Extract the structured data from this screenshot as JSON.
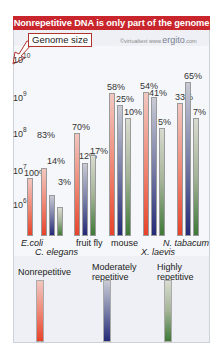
{
  "title": "Nonrepetitive DNA is only part of the genome",
  "genome_label": "Genome size",
  "copyright": {
    "prefix": "©virtualtext  www.",
    "brand": "ergito",
    "suffix": ".com"
  },
  "colors": {
    "title_bg": "#c8262c",
    "nonrepetitive": "#e8432a",
    "moderately": "#242a78",
    "highly": "#3e7a36"
  },
  "y_axis": [
    {
      "base": "10",
      "exp": "10",
      "y": 60
    },
    {
      "base": "10",
      "exp": "9",
      "y": 98
    },
    {
      "base": "10",
      "exp": "8",
      "y": 134
    },
    {
      "base": "10",
      "exp": "7",
      "y": 170
    },
    {
      "base": "10",
      "exp": "6",
      "y": 205
    }
  ],
  "legend": [
    {
      "line1": "Nonrepetitive",
      "line2": ""
    },
    {
      "line1": "Moderately",
      "line2": "repetitive"
    },
    {
      "line1": "Highly",
      "line2": "repetitive"
    }
  ],
  "chart_data": {
    "type": "bar",
    "title": "Nonrepetitive DNA is only part of the genome",
    "ylabel": "Genome size",
    "yscale": "log",
    "ylim": [
      1000000,
      10000000000
    ],
    "yticks": [
      "10^6",
      "10^7",
      "10^8",
      "10^9",
      "10^10"
    ],
    "categories": [
      "E.coli",
      "C. elegans",
      "fruit fly",
      "mouse",
      "X. laevis",
      "N. tabacum"
    ],
    "series": [
      {
        "name": "Nonrepetitive",
        "percent_labels": [
          "100%",
          "83%",
          "70%",
          "58%",
          "54%",
          "33%"
        ],
        "approx_values": [
          4000000,
          80000000,
          100000000,
          1800000000,
          1700000000,
          1300000000
        ]
      },
      {
        "name": "Moderately repetitive",
        "percent_labels": [
          null,
          "14%",
          "12%",
          "25%",
          "41%",
          "65%"
        ],
        "approx_values": [
          null,
          14000000,
          20000000,
          800000000,
          1300000000,
          2600000000
        ]
      },
      {
        "name": "Highly repetitive",
        "percent_labels": [
          null,
          "3%",
          "17%",
          "10%",
          "5%",
          "7%"
        ],
        "approx_values": [
          null,
          3000000,
          30000000,
          300000000,
          160000000,
          300000000
        ]
      }
    ],
    "grid": false,
    "legend_position": "bottom"
  },
  "bars": [
    {
      "x": 27,
      "top": 178,
      "cls": "r",
      "label": "100%",
      "lx": 24,
      "ly": 168
    },
    {
      "x": 41,
      "top": 168,
      "cls": "r",
      "label": "83%",
      "lx": 37,
      "ly": 130
    },
    {
      "x": 49,
      "top": 195,
      "cls": "b",
      "label": "14%",
      "lx": 47,
      "ly": 156
    },
    {
      "x": 57,
      "top": 207,
      "cls": "g",
      "label": "3%",
      "lx": 58,
      "ly": 177
    },
    {
      "x": 74,
      "top": 133,
      "cls": "r",
      "label": "70%",
      "lx": 72,
      "ly": 122
    },
    {
      "x": 82,
      "top": 163,
      "cls": "b",
      "label": "12%",
      "lx": 79,
      "ly": 151
    },
    {
      "x": 90,
      "top": 155,
      "cls": "g",
      "label": "17%",
      "lx": 90,
      "ly": 146
    },
    {
      "x": 109,
      "top": 93,
      "cls": "r",
      "label": "58%",
      "lx": 107,
      "ly": 82
    },
    {
      "x": 117,
      "top": 105,
      "cls": "b",
      "label": "25%",
      "lx": 116,
      "ly": 94
    },
    {
      "x": 125,
      "top": 118,
      "cls": "g",
      "label": "10%",
      "lx": 124,
      "ly": 107
    },
    {
      "x": 143,
      "top": 92,
      "cls": "r",
      "label": "54%",
      "lx": 140,
      "ly": 81
    },
    {
      "x": 151,
      "top": 97,
      "cls": "b",
      "label": "41%",
      "lx": 149,
      "ly": 88
    },
    {
      "x": 159,
      "top": 128,
      "cls": "g",
      "label": "5%",
      "lx": 158,
      "ly": 117
    },
    {
      "x": 177,
      "top": 103,
      "cls": "r",
      "label": "33%",
      "lx": 175,
      "ly": 92
    },
    {
      "x": 185,
      "top": 82,
      "cls": "b",
      "label": "65%",
      "lx": 184,
      "ly": 71
    },
    {
      "x": 193,
      "top": 118,
      "cls": "g",
      "label": "7%",
      "lx": 193,
      "ly": 107
    }
  ]
}
